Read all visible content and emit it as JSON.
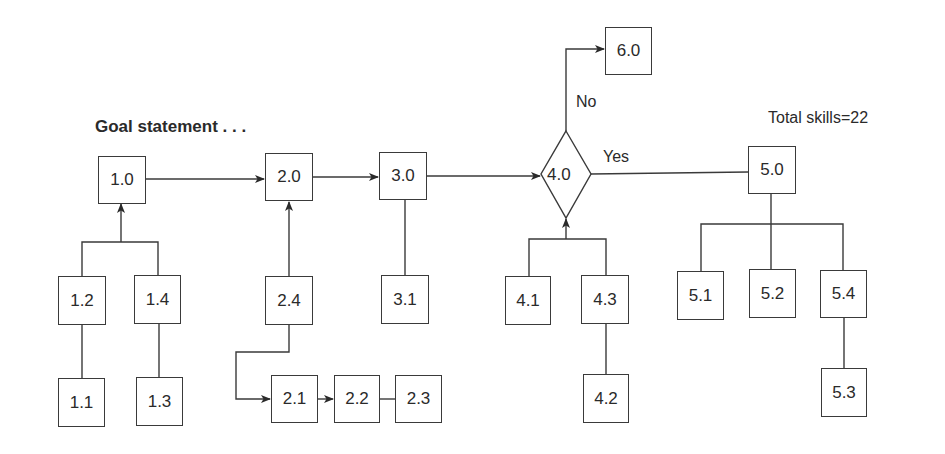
{
  "diagram": {
    "title": "Goal statement . . .",
    "total_label": "Total skills=22",
    "decision": {
      "id": "4.0",
      "yes_label": "Yes",
      "no_label": "No"
    },
    "nodes": {
      "n1_0": "1.0",
      "n1_1": "1.1",
      "n1_2": "1.2",
      "n1_3": "1.3",
      "n1_4": "1.4",
      "n2_0": "2.0",
      "n2_1": "2.1",
      "n2_2": "2.2",
      "n2_3": "2.3",
      "n2_4": "2.4",
      "n3_0": "3.0",
      "n3_1": "3.1",
      "n4_1": "4.1",
      "n4_2": "4.2",
      "n4_3": "4.3",
      "n5_0": "5.0",
      "n5_1": "5.1",
      "n5_2": "5.2",
      "n5_3": "5.3",
      "n5_4": "5.4",
      "n6_0": "6.0"
    },
    "edges": [
      {
        "from": "1.0",
        "to": "2.0",
        "arrow": true
      },
      {
        "from": "2.0",
        "to": "3.0",
        "arrow": true
      },
      {
        "from": "3.0",
        "to": "4.0",
        "arrow": true
      },
      {
        "from": "4.0",
        "to": "5.0",
        "label": "Yes"
      },
      {
        "from": "4.0",
        "to": "6.0",
        "label": "No",
        "arrow": true
      },
      {
        "from": "1.2",
        "to": "1.0",
        "arrow": true
      },
      {
        "from": "1.4",
        "to": "1.0",
        "arrow": true
      },
      {
        "from": "1.1",
        "to": "1.2"
      },
      {
        "from": "1.3",
        "to": "1.4"
      },
      {
        "from": "2.4",
        "to": "2.0",
        "arrow": true
      },
      {
        "from": "2.4",
        "to": "2.1",
        "arrow": true
      },
      {
        "from": "2.1",
        "to": "2.2",
        "arrow": true
      },
      {
        "from": "2.2",
        "to": "2.3"
      },
      {
        "from": "3.1",
        "to": "3.0"
      },
      {
        "from": "4.1",
        "to": "4.0",
        "arrow": true
      },
      {
        "from": "4.3",
        "to": "4.0",
        "arrow": true
      },
      {
        "from": "4.2",
        "to": "4.3"
      },
      {
        "from": "5.0",
        "to": "5.1"
      },
      {
        "from": "5.0",
        "to": "5.2"
      },
      {
        "from": "5.0",
        "to": "5.4"
      },
      {
        "from": "5.4",
        "to": "5.3"
      }
    ],
    "colors": {
      "stroke": "#3a3a3a",
      "text": "#2a2a2a",
      "background": "#ffffff"
    }
  }
}
